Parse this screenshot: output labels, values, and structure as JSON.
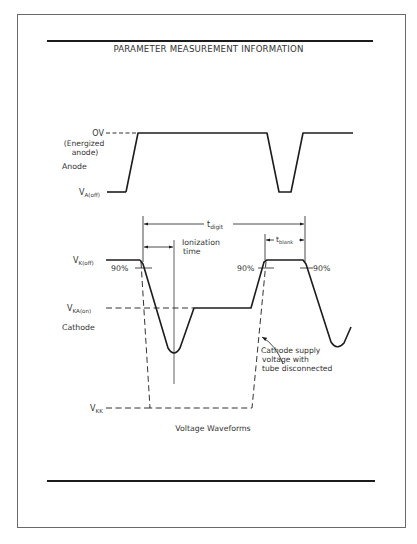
{
  "document": {
    "title": "PARAMETER MEASUREMENT INFORMATION",
    "caption": "Voltage Waveforms"
  },
  "anode": {
    "label": "Anode",
    "level_high_label": "OV",
    "level_high_note_line1": "(Energized",
    "level_high_note_line2": "anode)",
    "level_low_label_main": "V",
    "level_low_label_sub": "A(off)"
  },
  "cathode": {
    "label": "Cathode",
    "vk_off_main": "V",
    "vk_off_sub": "K(off)",
    "vka_on_main": "V",
    "vka_on_sub": "KA(on)",
    "vkk_main": "V",
    "vkk_sub": "KK",
    "pct_left": "90%",
    "pct_mid": "90%",
    "pct_right": "90%"
  },
  "timing": {
    "t_digit_main": "t",
    "t_digit_sub": "digit",
    "t_blank_main": "t",
    "t_blank_sub": "blank",
    "ionization_line1": "Ionization",
    "ionization_line2": "time"
  },
  "annotation": {
    "line1": "Cathode supply",
    "line2": "voltage with",
    "line3": "tube disconnected"
  },
  "colors": {
    "ink": "#1c1c1c",
    "frame": "#6a6a6a",
    "background": "#ffffff"
  }
}
